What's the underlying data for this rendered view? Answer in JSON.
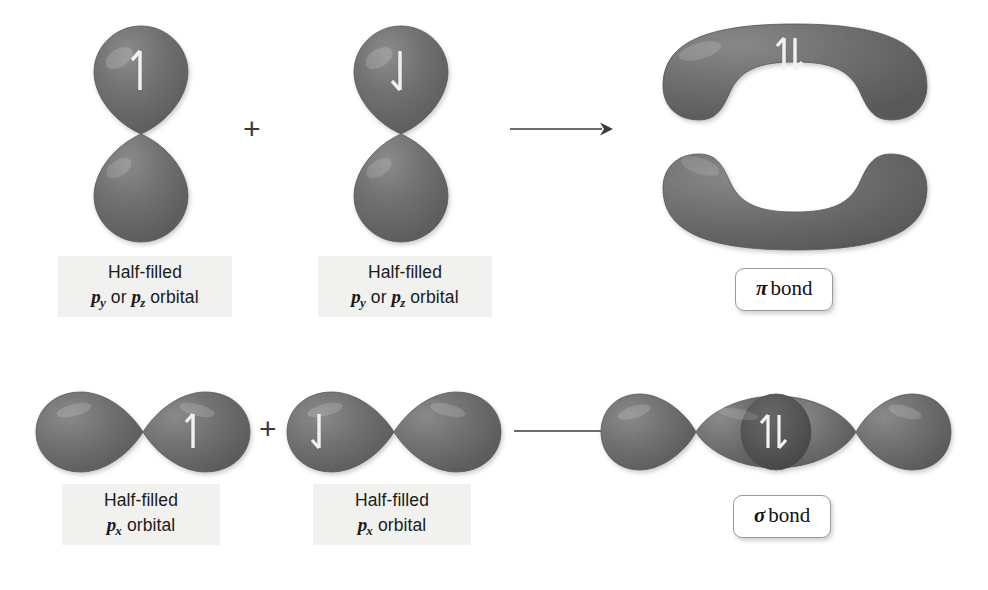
{
  "figure": {
    "background_color": "#ffffff",
    "orbital_color": "#6e6e6e",
    "orbital_dark_color": "#5a5a5a",
    "arrow_color": "#3b3b3b",
    "label_bg_color": "#f1f1ef"
  },
  "rows": [
    {
      "id": "pi-row",
      "reactant_left": {
        "name": "p-orbital-vertical-spin-up",
        "spin": "↑",
        "orientation": "vertical",
        "label": {
          "line1": "Half-filled",
          "line2_prefix": "p",
          "line2_sub1": "y",
          "line2_mid": " or ",
          "line2_prefix2": "p",
          "line2_sub2": "z",
          "line2_suffix": " orbital"
        }
      },
      "operator": "+",
      "reactant_right": {
        "name": "p-orbital-vertical-spin-down",
        "spin": "↓",
        "orientation": "vertical",
        "label": {
          "line1": "Half-filled",
          "line2_prefix": "p",
          "line2_sub1": "y",
          "line2_mid": " or ",
          "line2_prefix2": "p",
          "line2_sub2": "z",
          "line2_suffix": " orbital"
        }
      },
      "reaction_arrow": "→",
      "product": {
        "name": "pi-bond-orbital",
        "spin": "↑↓",
        "bond_symbol": "π",
        "bond_word": "bond"
      }
    },
    {
      "id": "sigma-row",
      "reactant_left": {
        "name": "px-orbital-horizontal-spin-up",
        "spin": "↑",
        "orientation": "horizontal",
        "label": {
          "line1": "Half-filled",
          "line2_prefix": "p",
          "line2_sub1": "x",
          "line2_suffix": " orbital"
        }
      },
      "operator": "+",
      "reactant_right": {
        "name": "px-orbital-horizontal-spin-down",
        "spin": "↓",
        "orientation": "horizontal",
        "label": {
          "line1": "Half-filled",
          "line2_prefix": "p",
          "line2_sub1": "x",
          "line2_suffix": " orbital"
        }
      },
      "reaction_arrow": "→",
      "product": {
        "name": "sigma-bond-orbital",
        "spin": "↑↓",
        "bond_symbol": "σ",
        "bond_word": "bond"
      }
    }
  ],
  "labels": {
    "half_filled": "Half-filled",
    "orbital_word": " orbital",
    "or_word": " or ",
    "p": "p",
    "sub_x": "x",
    "sub_y": "y",
    "sub_z": "z",
    "plus": "+",
    "pi": "π",
    "sigma": "σ",
    "bond": "bond",
    "spin_up": "↑",
    "spin_down": "↓",
    "spin_paired": "↑↓"
  }
}
